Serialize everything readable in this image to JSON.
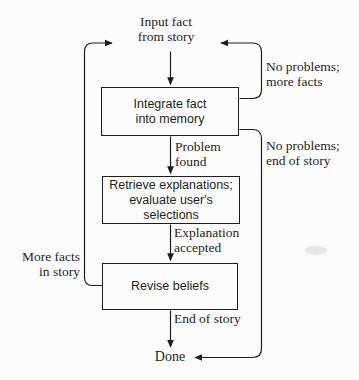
{
  "diagram": {
    "title_implied": "Fact-processing control loop",
    "colors": {
      "ink": "#1e1e1e",
      "background": "#fcfcfc"
    },
    "nodes": {
      "input_fact": {
        "line1": "Input fact",
        "line2": "from story"
      },
      "integrate": {
        "line1": "Integrate fact",
        "line2": "into memory"
      },
      "retrieve": {
        "line1": "Retrieve explanations;",
        "line2": "evaluate user's",
        "line3": "selections"
      },
      "revise": {
        "label": "Revise beliefs"
      },
      "done": {
        "label": "Done"
      }
    },
    "edge_labels": {
      "problem_found": {
        "line1": "Problem",
        "line2": "found"
      },
      "explanation_accepted": {
        "line1": "Explanation",
        "line2": "accepted"
      },
      "end_of_story": {
        "label": "End of story"
      },
      "no_problems_more_facts": {
        "line1": "No problems;",
        "line2": "more facts"
      },
      "no_problems_end_of_story": {
        "line1": "No problems;",
        "line2": "end of story"
      },
      "more_facts_in_story": {
        "line1": "More facts",
        "line2": "in story"
      }
    }
  }
}
